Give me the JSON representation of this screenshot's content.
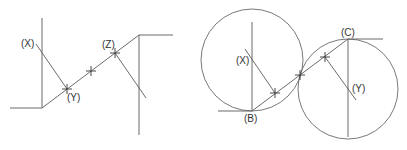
{
  "figures": [
    {
      "id": "left-figure",
      "description": "Reverse curve construction with straight lines",
      "labels": [
        {
          "text": "(X)",
          "x": 21,
          "y": 47
        },
        {
          "text": "(Y)",
          "x": 67,
          "y": 101
        },
        {
          "text": "(Z)",
          "x": 102,
          "y": 48
        }
      ]
    },
    {
      "id": "right-figure",
      "description": "Reverse curve with two tangent circles",
      "labels": [
        {
          "text": "(X)",
          "x": 236,
          "y": 64
        },
        {
          "text": "(B)",
          "x": 244,
          "y": 122
        },
        {
          "text": "(C)",
          "x": 341,
          "y": 36
        },
        {
          "text": "(Y)",
          "x": 352,
          "y": 92
        }
      ]
    }
  ],
  "colors": {
    "line": "#5a5a5a",
    "circle": "#6a6a6a",
    "label": "#333333",
    "background": "#ffffff"
  }
}
